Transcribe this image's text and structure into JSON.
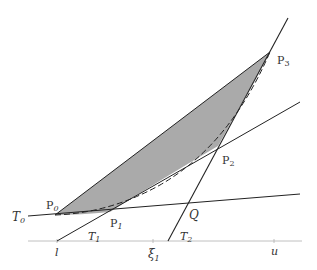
{
  "diagram": {
    "title": "",
    "colors": {
      "background": "#ffffff",
      "line": "#222222",
      "axis": "#aaaaaa",
      "fill": "#aaaaaa",
      "label": "#333333"
    },
    "points": {
      "P0": {
        "label": "P",
        "sub": "0",
        "x": 55,
        "y": 215
      },
      "P1": {
        "label": "P",
        "sub": "1",
        "x": 110,
        "y": 212
      },
      "P2": {
        "label": "P",
        "sub": "2",
        "x": 218,
        "y": 146
      },
      "P3": {
        "label": "P",
        "sub": "3",
        "x": 270,
        "y": 52
      },
      "Q": {
        "label": "Q",
        "x": 187,
        "y": 203
      }
    },
    "tangents": {
      "T0": {
        "label": "T",
        "sub": "0"
      },
      "T1": {
        "label": "T",
        "sub": "1"
      },
      "T2": {
        "label": "T",
        "sub": "2"
      }
    },
    "axis": {
      "ticks": [
        {
          "label": "l",
          "x": 57
        },
        {
          "label": "ξ",
          "sub": "1",
          "x": 153
        },
        {
          "label": "u",
          "x": 274
        }
      ]
    }
  }
}
